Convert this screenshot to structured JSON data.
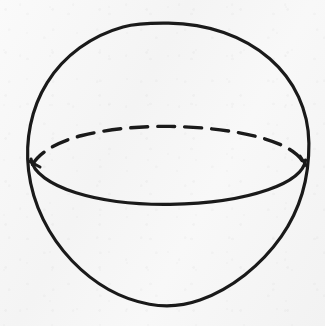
{
  "figure": {
    "title": "Sphere with equator",
    "kind": "line-drawing",
    "medium": "scanned hand-drawn ink on paper",
    "canvas": {
      "width": 325,
      "height": 326
    },
    "colors": {
      "ink": "#1a1a1a",
      "paper": "#f6f6f6"
    },
    "shapes": {
      "outline_circle": {
        "name": "sphere-outline",
        "center_x": 168,
        "center_y": 164,
        "radius": 141,
        "stroke_width": 3.2,
        "style": "solid"
      },
      "equator_front": {
        "name": "equator-front-arc",
        "center_x": 168,
        "center_y": 166,
        "radius_x": 136,
        "radius_y": 37,
        "stroke_width": 3.2,
        "style": "solid",
        "half": "lower"
      },
      "equator_back": {
        "name": "equator-back-arc",
        "center_x": 168,
        "center_y": 166,
        "radius_x": 136,
        "radius_y": 37,
        "stroke_width": 3.4,
        "style": "dashed",
        "half": "upper",
        "dash_length": 17,
        "gap_length": 10,
        "dash_count": 11
      }
    },
    "junctions": {
      "left": {
        "x": 32,
        "y": 164
      },
      "right": {
        "x": 304,
        "y": 164
      }
    }
  }
}
